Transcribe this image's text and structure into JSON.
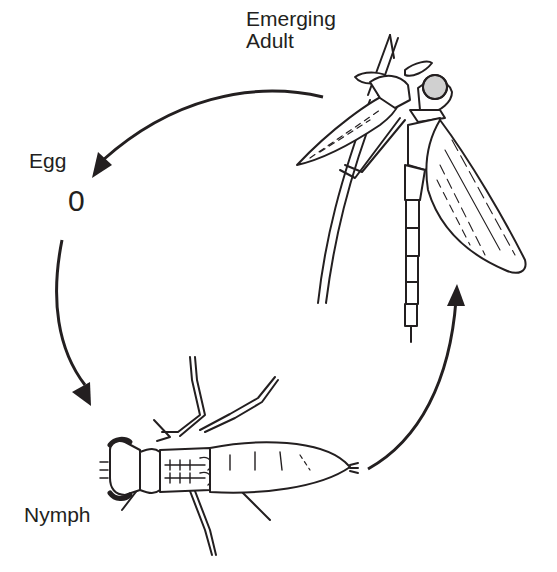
{
  "diagram": {
    "colors": {
      "ink": "#231f20",
      "background": "#ffffff"
    },
    "stages": [
      {
        "id": "egg",
        "label": "Egg",
        "glyph": "0"
      },
      {
        "id": "nymph",
        "label": "Nymph"
      },
      {
        "id": "emerging_adult",
        "label_line1": "Emerging",
        "label_line2": "Adult"
      }
    ],
    "arrows": [
      {
        "from": "emerging_adult",
        "to": "egg"
      },
      {
        "from": "egg",
        "to": "nymph"
      },
      {
        "from": "nymph",
        "to": "emerging_adult"
      }
    ]
  }
}
